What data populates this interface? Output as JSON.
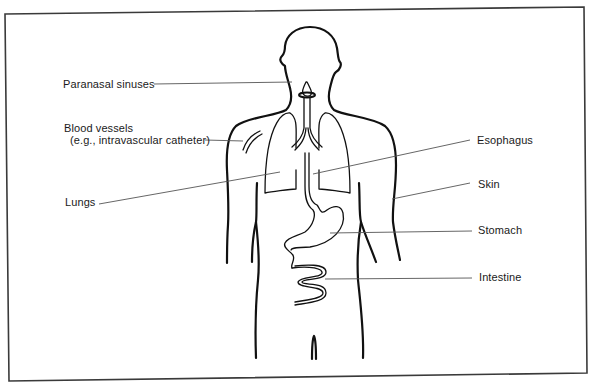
{
  "diagram": {
    "type": "anatomical-labeled-illustration",
    "labels_left": [
      {
        "id": "paranasal-sinuses",
        "text": "Paranasal sinuses"
      },
      {
        "id": "blood-vessels",
        "text": "Blood vessels"
      },
      {
        "id": "blood-vessels-sub",
        "text": "(e.g., intravascular catheter)"
      },
      {
        "id": "lungs",
        "text": "Lungs"
      }
    ],
    "labels_right": [
      {
        "id": "esophagus",
        "text": "Esophagus"
      },
      {
        "id": "skin",
        "text": "Skin"
      },
      {
        "id": "stomach",
        "text": "Stomach"
      },
      {
        "id": "intestine",
        "text": "Intestine"
      }
    ],
    "colors": {
      "line": "#111111",
      "leader": "#555555",
      "frame": "#3a3a3a",
      "background": "#ffffff"
    }
  }
}
